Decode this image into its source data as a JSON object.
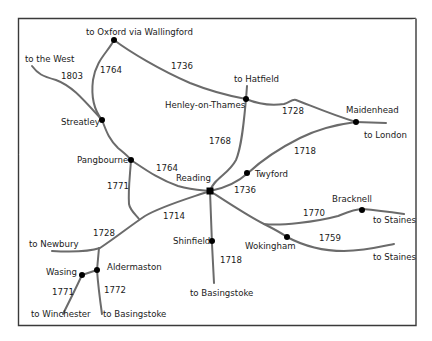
{
  "colors": {
    "road": "#6b6b6b",
    "node": "#000000",
    "frame": "#3a3a3a",
    "background": "#ffffff"
  },
  "towns": {
    "reading": "Reading",
    "henley": "Henley-on-Thames",
    "maidenhead": "Maidenhead",
    "streatley": "Streatley",
    "pangbourne": "Pangbourne",
    "twyford": "Twyford",
    "shinfield": "Shinfield",
    "wokingham": "Wokingham",
    "bracknell": "Bracknell",
    "aldermaston": "Aldermaston",
    "wasing": "Wasing"
  },
  "destinations": {
    "oxford": "to Oxford via Wallingford",
    "west": "to the West",
    "hatfield": "to Hatfield",
    "london": "to London",
    "newbury": "to Newbury",
    "basingstoke_south": "to Basingstoke",
    "staines_north": "to Staines",
    "staines_south": "to Staines",
    "winchester": "to Winchester",
    "basingstoke_sw": "to Basingstoke"
  },
  "roads": [
    {
      "id": "oxford-henley",
      "year": "1736"
    },
    {
      "id": "oxford-streatley",
      "year": "1764"
    },
    {
      "id": "west-streatley",
      "year": "1803"
    },
    {
      "id": "henley-maidenhead",
      "year": "1728"
    },
    {
      "id": "hatfield-reading",
      "year": "1768"
    },
    {
      "id": "maidenhead-twyford",
      "year": "1718"
    },
    {
      "id": "pangbourne-reading",
      "year": "1764"
    },
    {
      "id": "twyford-reading",
      "year": "1736"
    },
    {
      "id": "pangbourne-south",
      "year": "1771"
    },
    {
      "id": "reading-newbury",
      "year": "1714"
    },
    {
      "id": "newbury-west",
      "year": "1728"
    },
    {
      "id": "reading-bracknell",
      "year": "1770"
    },
    {
      "id": "wokingham-staines",
      "year": "1759"
    },
    {
      "id": "reading-basingstoke",
      "year": "1718"
    },
    {
      "id": "wasing-winchester",
      "year": "1771"
    },
    {
      "id": "aldermaston-basingstoke",
      "year": "1772"
    }
  ]
}
